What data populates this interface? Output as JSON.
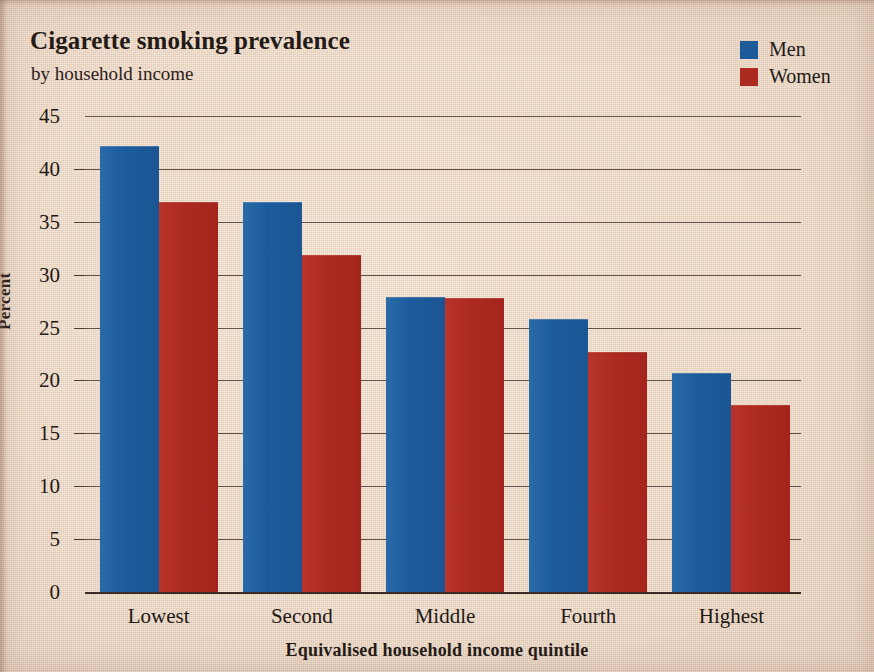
{
  "title": "Cigarette smoking prevalence",
  "subtitle": "by household income",
  "legend": {
    "items": [
      {
        "label": "Men",
        "color": "#1d5c9c"
      },
      {
        "label": "Women",
        "color": "#ad2a20"
      }
    ]
  },
  "axes": {
    "y_title": "Percent",
    "x_title": "Equivalised household income quintile",
    "y_ticks": [
      "0",
      "5",
      "10",
      "15",
      "20",
      "25",
      "30",
      "35",
      "40",
      "45"
    ]
  },
  "chart_data": {
    "type": "bar",
    "title": "Cigarette smoking prevalence",
    "subtitle": "by household income",
    "xlabel": "Equivalised household income quintile",
    "ylabel": "Percent",
    "categories": [
      "Lowest",
      "Second",
      "Middle",
      "Fourth",
      "Highest"
    ],
    "series": [
      {
        "name": "Men",
        "color": "#1d5c9c",
        "values": [
          42.2,
          36.9,
          27.9,
          25.8,
          20.7
        ]
      },
      {
        "name": "Women",
        "color": "#ad2a20",
        "values": [
          36.9,
          31.9,
          27.8,
          22.7,
          17.7
        ]
      }
    ],
    "ylim": [
      0,
      45
    ],
    "ytick_step": 5,
    "grid": true,
    "legend_position": "top-right",
    "bar_gap_within_group": 0,
    "orientation": "vertical"
  }
}
